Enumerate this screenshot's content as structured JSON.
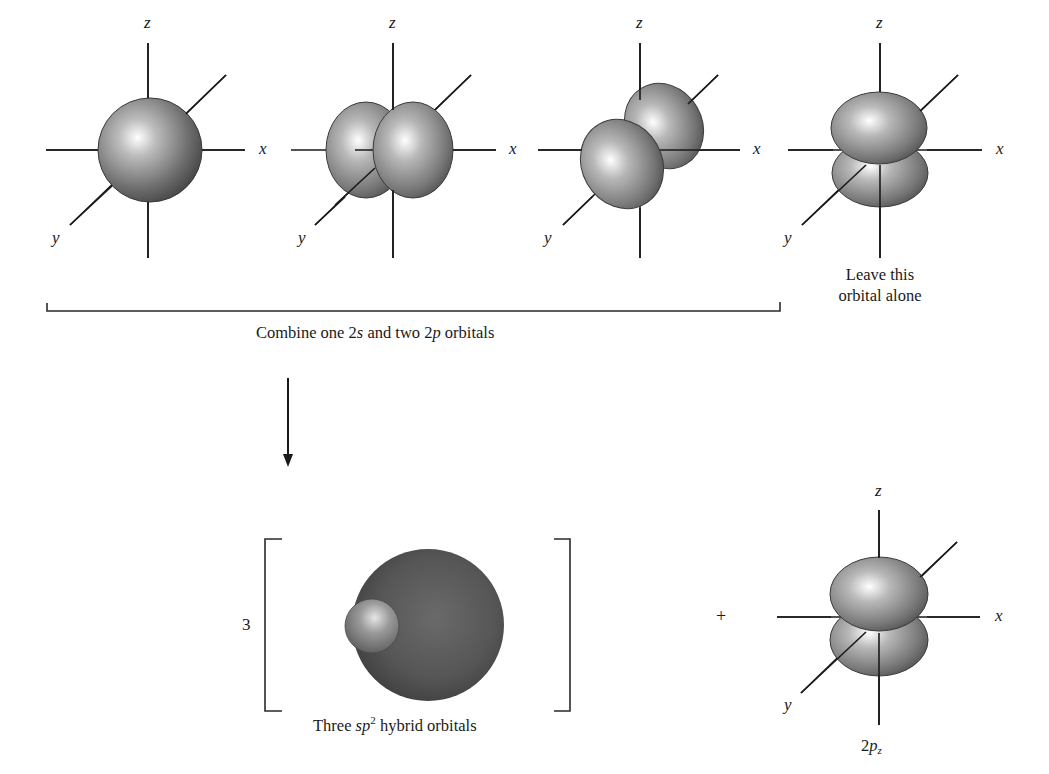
{
  "diagram": {
    "axis_labels": {
      "x": "x",
      "y": "y",
      "z": "z"
    },
    "top_row": {
      "orbitals": [
        {
          "id": "2s",
          "shape": "sphere"
        },
        {
          "id": "2px",
          "shape": "p-lobes-along-x"
        },
        {
          "id": "2py",
          "shape": "p-lobes-along-y"
        },
        {
          "id": "2pz",
          "shape": "p-lobes-along-z"
        }
      ],
      "bracket_caption": {
        "prefix": "Combine one 2",
        "s": "s",
        "mid": " and two 2",
        "p": "p",
        "suffix": " orbitals"
      },
      "leave_alone_caption": {
        "line1": "Leave this",
        "line2": "orbital alone"
      }
    },
    "arrow": {
      "direction": "down"
    },
    "bottom_row": {
      "multiplier": "3",
      "hybrid_caption": {
        "prefix": "Three ",
        "sp": "sp",
        "sup": "2",
        "suffix": " hybrid orbitals"
      },
      "plus": "+",
      "pz_caption": {
        "base": "2",
        "p": "p",
        "sub": "z"
      }
    },
    "colors": {
      "line": "#1a1a1a",
      "orbital_dark": "#3c3c3c",
      "orbital_mid": "#8a8a8a",
      "orbital_light": "#ffffff"
    }
  }
}
